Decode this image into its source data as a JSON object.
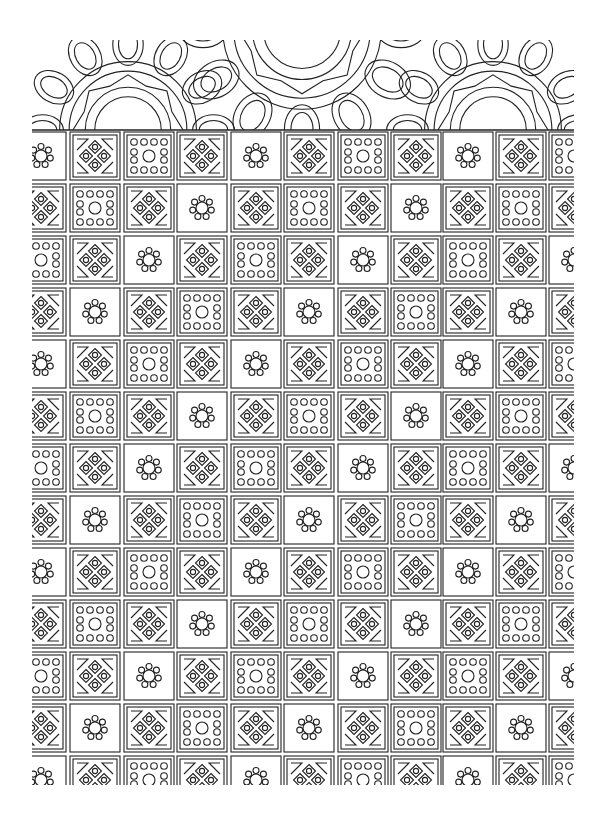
{
  "page": {
    "title": "Geometric tile pattern coloring page",
    "background": "#ffffff",
    "line_color": "#222222"
  },
  "grid": {
    "left": 32,
    "right": 574,
    "top": 130,
    "bottom": 785,
    "col_x": [
      16,
      70,
      124,
      177,
      231,
      284,
      338,
      391,
      443,
      496,
      549
    ],
    "row_y": [
      130,
      182,
      234,
      286,
      338,
      390,
      442,
      494,
      546,
      598,
      650,
      702,
      754
    ],
    "tile_w": 50,
    "tile_h": 48,
    "cycle": [
      "flower",
      "cross",
      "dots",
      "cross"
    ],
    "row_offsets": [
      0,
      1,
      2,
      3,
      0,
      1,
      2,
      3,
      0,
      1,
      2,
      3,
      0
    ]
  },
  "tile_types": {
    "flower": "flower-tile-icon",
    "cross": "diamond-cross-tile-icon",
    "dots": "dot-ring-tile-icon"
  },
  "header": {
    "mandalas": [
      {
        "name": "left-mandala",
        "cx": 128,
        "cy": 130,
        "r": 95
      },
      {
        "name": "center-mandala",
        "cx": 302,
        "cy": 30,
        "r": 110
      },
      {
        "name": "right-mandala",
        "cx": 493,
        "cy": 130,
        "r": 95
      }
    ]
  }
}
